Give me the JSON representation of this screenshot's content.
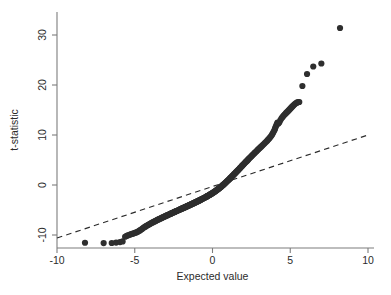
{
  "figure": {
    "background_color": "#ffffff",
    "point_color": "#2e2e2e",
    "axis_color": "#7d7d7d",
    "reference_line_color": "#2b2b2b"
  },
  "axes": {
    "x_title": "Expected value",
    "y_title": "t-statistic",
    "x_ticks": [
      "-10",
      "-5",
      "0",
      "5",
      "10"
    ],
    "y_ticks": [
      "-10",
      "0",
      "10",
      "20",
      "30"
    ]
  },
  "chart_data": {
    "type": "scatter",
    "title": "",
    "subtitle": "",
    "xlabel": "Expected value",
    "ylabel": "t-statistic",
    "xlim": [
      -10,
      10
    ],
    "ylim": [
      -13,
      33
    ],
    "xticks": [
      -10,
      -5,
      0,
      5,
      10
    ],
    "yticks": [
      -10,
      0,
      10,
      20,
      30
    ],
    "grid": false,
    "legend": "none",
    "annotations": [],
    "reference_line": {
      "name": "identity-reference-line",
      "style": "dashed",
      "x": [
        -10.0,
        10.0
      ],
      "y": [
        -10.6,
        10.0
      ]
    },
    "series": [
      {
        "name": "t-statistic quantiles",
        "marker": "filled-circle",
        "marker_size_px": 3.1,
        "points": [
          [
            -8.2,
            -11.55
          ],
          [
            -7.0,
            -11.62
          ],
          [
            -6.48,
            -11.6
          ],
          [
            -6.2,
            -11.52
          ],
          [
            -5.95,
            -11.42
          ],
          [
            -5.78,
            -11.28
          ],
          [
            -5.62,
            -10.35
          ],
          [
            -5.52,
            -10.18
          ],
          [
            -5.43,
            -10.05
          ],
          [
            -5.34,
            -9.95
          ],
          [
            -5.26,
            -9.86
          ],
          [
            -5.18,
            -9.78
          ],
          [
            -5.1,
            -9.7
          ],
          [
            -5.02,
            -9.62
          ],
          [
            -4.95,
            -9.54
          ],
          [
            -4.88,
            -9.45
          ],
          [
            -4.81,
            -9.35
          ],
          [
            -4.74,
            -9.22
          ],
          [
            -4.67,
            -9.08
          ],
          [
            -4.61,
            -8.95
          ],
          [
            -4.54,
            -8.8
          ],
          [
            -4.48,
            -8.66
          ],
          [
            -4.42,
            -8.52
          ],
          [
            -4.36,
            -8.4
          ],
          [
            -4.3,
            -8.28
          ],
          [
            -4.24,
            -8.16
          ],
          [
            -4.18,
            -8.05
          ],
          [
            -4.12,
            -7.95
          ],
          [
            -4.07,
            -7.85
          ],
          [
            -4.01,
            -7.75
          ],
          [
            -3.96,
            -7.66
          ],
          [
            -3.9,
            -7.57
          ],
          [
            -3.85,
            -7.48
          ],
          [
            -3.8,
            -7.4
          ],
          [
            -3.74,
            -7.31
          ],
          [
            -3.69,
            -7.23
          ],
          [
            -3.64,
            -7.15
          ],
          [
            -3.59,
            -7.07
          ],
          [
            -3.54,
            -6.99
          ],
          [
            -3.49,
            -6.92
          ],
          [
            -3.44,
            -6.84
          ],
          [
            -3.39,
            -6.77
          ],
          [
            -3.35,
            -6.7
          ],
          [
            -3.3,
            -6.63
          ],
          [
            -3.25,
            -6.56
          ],
          [
            -3.21,
            -6.49
          ],
          [
            -3.16,
            -6.42
          ],
          [
            -3.11,
            -6.35
          ],
          [
            -3.07,
            -6.29
          ],
          [
            -3.02,
            -6.22
          ],
          [
            -2.98,
            -6.16
          ],
          [
            -2.94,
            -6.09
          ],
          [
            -2.89,
            -6.03
          ],
          [
            -2.85,
            -5.97
          ],
          [
            -2.81,
            -5.91
          ],
          [
            -2.76,
            -5.85
          ],
          [
            -2.72,
            -5.79
          ],
          [
            -2.68,
            -5.73
          ],
          [
            -2.64,
            -5.67
          ],
          [
            -2.6,
            -5.61
          ],
          [
            -2.56,
            -5.55
          ],
          [
            -2.52,
            -5.5
          ],
          [
            -2.48,
            -5.44
          ],
          [
            -2.44,
            -5.38
          ],
          [
            -2.4,
            -5.33
          ],
          [
            -2.36,
            -5.27
          ],
          [
            -2.32,
            -5.22
          ],
          [
            -2.28,
            -5.16
          ],
          [
            -2.24,
            -5.11
          ],
          [
            -2.2,
            -5.05
          ],
          [
            -2.17,
            -5.0
          ],
          [
            -2.13,
            -4.95
          ],
          [
            -2.09,
            -4.89
          ],
          [
            -2.05,
            -4.84
          ],
          [
            -2.02,
            -4.79
          ],
          [
            -1.98,
            -4.74
          ],
          [
            -1.94,
            -4.69
          ],
          [
            -1.91,
            -4.63
          ],
          [
            -1.87,
            -4.58
          ],
          [
            -1.83,
            -4.53
          ],
          [
            -1.8,
            -4.48
          ],
          [
            -1.76,
            -4.43
          ],
          [
            -1.73,
            -4.38
          ],
          [
            -1.69,
            -4.33
          ],
          [
            -1.66,
            -4.28
          ],
          [
            -1.62,
            -4.23
          ],
          [
            -1.59,
            -4.18
          ],
          [
            -1.55,
            -4.13
          ],
          [
            -1.52,
            -4.08
          ],
          [
            -1.48,
            -4.03
          ],
          [
            -1.45,
            -3.98
          ],
          [
            -1.41,
            -3.93
          ],
          [
            -1.38,
            -3.88
          ],
          [
            -1.35,
            -3.83
          ],
          [
            -1.31,
            -3.78
          ],
          [
            -1.28,
            -3.73
          ],
          [
            -1.24,
            -3.68
          ],
          [
            -1.21,
            -3.63
          ],
          [
            -1.18,
            -3.58
          ],
          [
            -1.14,
            -3.53
          ],
          [
            -1.11,
            -3.48
          ],
          [
            -1.08,
            -3.43
          ],
          [
            -1.04,
            -3.38
          ],
          [
            -1.01,
            -3.33
          ],
          [
            -0.98,
            -3.28
          ],
          [
            -0.94,
            -3.23
          ],
          [
            -0.91,
            -3.18
          ],
          [
            -0.88,
            -3.13
          ],
          [
            -0.85,
            -3.08
          ],
          [
            -0.81,
            -3.03
          ],
          [
            -0.78,
            -2.98
          ],
          [
            -0.75,
            -2.93
          ],
          [
            -0.72,
            -2.87
          ],
          [
            -0.68,
            -2.82
          ],
          [
            -0.65,
            -2.77
          ],
          [
            -0.62,
            -2.72
          ],
          [
            -0.59,
            -2.67
          ],
          [
            -0.55,
            -2.61
          ],
          [
            -0.52,
            -2.56
          ],
          [
            -0.49,
            -2.51
          ],
          [
            -0.46,
            -2.45
          ],
          [
            -0.43,
            -2.4
          ],
          [
            -0.39,
            -2.34
          ],
          [
            -0.36,
            -2.29
          ],
          [
            -0.33,
            -2.23
          ],
          [
            -0.3,
            -2.17
          ],
          [
            -0.27,
            -2.12
          ],
          [
            -0.23,
            -2.06
          ],
          [
            -0.2,
            -2.0
          ],
          [
            -0.17,
            -1.94
          ],
          [
            -0.14,
            -1.88
          ],
          [
            -0.11,
            -1.82
          ],
          [
            -0.07,
            -1.76
          ],
          [
            -0.04,
            -1.7
          ],
          [
            -0.01,
            -1.63
          ],
          [
            0.02,
            -1.57
          ],
          [
            0.05,
            -1.5
          ],
          [
            0.09,
            -1.44
          ],
          [
            0.12,
            -1.37
          ],
          [
            0.15,
            -1.3
          ],
          [
            0.18,
            -1.23
          ],
          [
            0.21,
            -1.16
          ],
          [
            0.25,
            -1.09
          ],
          [
            0.28,
            -1.02
          ],
          [
            0.31,
            -0.94
          ],
          [
            0.34,
            -0.87
          ],
          [
            0.37,
            -0.79
          ],
          [
            0.41,
            -0.71
          ],
          [
            0.44,
            -0.63
          ],
          [
            0.47,
            -0.55
          ],
          [
            0.5,
            -0.47
          ],
          [
            0.54,
            -0.38
          ],
          [
            0.57,
            -0.3
          ],
          [
            0.6,
            -0.21
          ],
          [
            0.63,
            -0.12
          ],
          [
            0.67,
            -0.03
          ],
          [
            0.7,
            0.06
          ],
          [
            0.73,
            0.15
          ],
          [
            0.77,
            0.25
          ],
          [
            0.8,
            0.34
          ],
          [
            0.83,
            0.44
          ],
          [
            0.87,
            0.54
          ],
          [
            0.9,
            0.64
          ],
          [
            0.93,
            0.74
          ],
          [
            0.97,
            0.84
          ],
          [
            1.0,
            0.94
          ],
          [
            1.04,
            1.05
          ],
          [
            1.07,
            1.15
          ],
          [
            1.11,
            1.26
          ],
          [
            1.14,
            1.37
          ],
          [
            1.18,
            1.48
          ],
          [
            1.21,
            1.59
          ],
          [
            1.25,
            1.7
          ],
          [
            1.28,
            1.81
          ],
          [
            1.32,
            1.93
          ],
          [
            1.36,
            2.04
          ],
          [
            1.39,
            2.16
          ],
          [
            1.43,
            2.28
          ],
          [
            1.47,
            2.4
          ],
          [
            1.5,
            2.52
          ],
          [
            1.54,
            2.64
          ],
          [
            1.58,
            2.77
          ],
          [
            1.62,
            2.89
          ],
          [
            1.66,
            3.02
          ],
          [
            1.7,
            3.15
          ],
          [
            1.74,
            3.28
          ],
          [
            1.78,
            3.41
          ],
          [
            1.82,
            3.55
          ],
          [
            1.86,
            3.68
          ],
          [
            1.9,
            3.82
          ],
          [
            1.94,
            3.96
          ],
          [
            1.99,
            4.1
          ],
          [
            2.03,
            4.24
          ],
          [
            2.07,
            4.38
          ],
          [
            2.12,
            4.53
          ],
          [
            2.16,
            4.67
          ],
          [
            2.21,
            4.82
          ],
          [
            2.26,
            4.97
          ],
          [
            2.3,
            5.12
          ],
          [
            2.35,
            5.28
          ],
          [
            2.4,
            5.43
          ],
          [
            2.45,
            5.59
          ],
          [
            2.5,
            5.75
          ],
          [
            2.55,
            5.91
          ],
          [
            2.61,
            6.08
          ],
          [
            2.66,
            6.24
          ],
          [
            2.71,
            6.41
          ],
          [
            2.77,
            6.58
          ],
          [
            2.83,
            6.75
          ],
          [
            2.88,
            6.93
          ],
          [
            2.94,
            7.11
          ],
          [
            3.0,
            7.29
          ],
          [
            3.06,
            7.47
          ],
          [
            3.13,
            7.66
          ],
          [
            3.19,
            7.85
          ],
          [
            3.25,
            8.04
          ],
          [
            3.32,
            8.24
          ],
          [
            3.38,
            8.44
          ],
          [
            3.45,
            8.65
          ],
          [
            3.52,
            8.86
          ],
          [
            3.58,
            9.08
          ],
          [
            3.65,
            9.31
          ],
          [
            3.71,
            9.55
          ],
          [
            3.77,
            9.8
          ],
          [
            3.83,
            10.07
          ],
          [
            3.88,
            10.35
          ],
          [
            3.93,
            10.64
          ],
          [
            3.98,
            10.95
          ],
          [
            4.02,
            11.26
          ],
          [
            4.06,
            11.58
          ],
          [
            4.1,
            11.9
          ],
          [
            4.14,
            12.2
          ],
          [
            4.18,
            12.47
          ],
          [
            4.24,
            12.28
          ],
          [
            4.3,
            12.55
          ],
          [
            4.37,
            13.0
          ],
          [
            4.44,
            13.35
          ],
          [
            4.51,
            13.62
          ],
          [
            4.58,
            13.88
          ],
          [
            4.64,
            14.1
          ],
          [
            4.71,
            14.32
          ],
          [
            4.77,
            14.52
          ],
          [
            4.84,
            14.72
          ],
          [
            4.9,
            14.92
          ],
          [
            4.96,
            15.12
          ],
          [
            5.02,
            15.32
          ],
          [
            5.08,
            15.52
          ],
          [
            5.14,
            15.72
          ],
          [
            5.2,
            15.9
          ],
          [
            5.26,
            16.08
          ],
          [
            5.32,
            16.25
          ],
          [
            5.38,
            16.4
          ],
          [
            5.45,
            16.52
          ],
          [
            5.52,
            16.58
          ],
          [
            5.58,
            16.6
          ],
          [
            5.78,
            19.8
          ],
          [
            6.08,
            22.2
          ],
          [
            6.48,
            23.7
          ],
          [
            7.0,
            24.3
          ],
          [
            8.2,
            31.4
          ]
        ]
      }
    ]
  }
}
